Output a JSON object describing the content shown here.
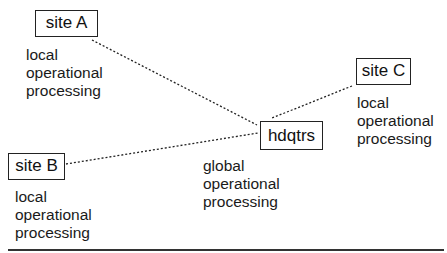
{
  "diagram": {
    "nodes": {
      "site_a": {
        "label": "site A",
        "caption": [
          "local",
          "operational",
          "processing"
        ]
      },
      "site_b": {
        "label": "site B",
        "caption": [
          "local",
          "operational",
          "processing"
        ]
      },
      "site_c": {
        "label": "site C",
        "caption": [
          "local",
          "operational",
          "processing"
        ]
      },
      "hdqtrs": {
        "label": "hdqtrs",
        "caption": [
          "global",
          "operational",
          "processing"
        ]
      }
    },
    "edges": [
      {
        "from": "site A",
        "to": "hdqtrs",
        "style": "dotted"
      },
      {
        "from": "site B",
        "to": "hdqtrs",
        "style": "dotted"
      },
      {
        "from": "site C",
        "to": "hdqtrs",
        "style": "dotted"
      }
    ]
  }
}
